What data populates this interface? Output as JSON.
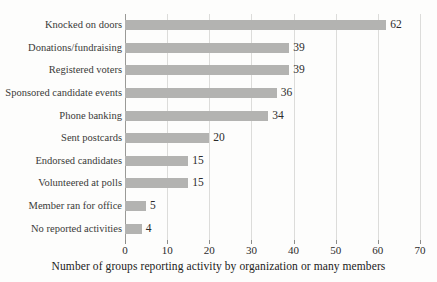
{
  "chart_data": {
    "type": "bar",
    "orientation": "horizontal",
    "title": "",
    "xlabel": "Number of groups reporting activity by organization or many members",
    "ylabel": "",
    "xlim": [
      0,
      70
    ],
    "xticks": [
      0,
      10,
      20,
      30,
      40,
      50,
      60,
      70
    ],
    "xtick_labels": [
      "0",
      "10",
      "20",
      "30",
      "40",
      "50",
      "60",
      "70"
    ],
    "grid": true,
    "grid_axis": "x",
    "legend": false,
    "bar_color": "#b3b3b1",
    "categories": [
      "Knocked on doors",
      "Donations/fundraising",
      "Registered voters",
      "Sponsored candidate events",
      "Phone banking",
      "Sent postcards",
      "Endorsed candidates",
      "Volunteered at polls",
      "Member ran for office",
      "No reported activities"
    ],
    "values": [
      62,
      39,
      39,
      36,
      34,
      20,
      15,
      15,
      5,
      4
    ],
    "value_labels": [
      "62",
      "39",
      "39",
      "36",
      "34",
      "20",
      "15",
      "15",
      "5",
      "4"
    ]
  }
}
